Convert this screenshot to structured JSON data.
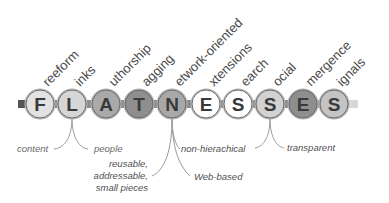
{
  "bar_color": "#7a7a7a",
  "circles": [
    {
      "letter": "F",
      "label": "reeform",
      "cx": 40,
      "fill": "#e2e2e2"
    },
    {
      "letter": "L",
      "label": "inks",
      "cx": 72,
      "fill": "#d6d6d6"
    },
    {
      "letter": "A",
      "label": "uthorship",
      "cx": 106,
      "fill": "#a9a9a9"
    },
    {
      "letter": "T",
      "label": "agging",
      "cx": 139,
      "fill": "#8e8e8e"
    },
    {
      "letter": "N",
      "label": "etwork-oriented",
      "cx": 172,
      "fill": "#a8a8a8"
    },
    {
      "letter": "E",
      "label": "xtensions",
      "cx": 206,
      "fill": "#ffffff"
    },
    {
      "letter": "S",
      "label": "earch",
      "cx": 238,
      "fill": "#ffffff"
    },
    {
      "letter": "S",
      "label": "ocial",
      "cx": 270,
      "fill": "#d2d2d2"
    },
    {
      "letter": "E",
      "label": "mergence",
      "cx": 303,
      "fill": "#8e8e8e"
    },
    {
      "letter": "S",
      "label": "ignals",
      "cx": 334,
      "fill": "#c4c4c4"
    }
  ],
  "annotations": {
    "links": {
      "left": "content",
      "right": "people"
    },
    "network_oriented": {
      "left_lines": [
        "reusable,",
        "addressable,",
        "small pieces"
      ],
      "right_top": "non-hierachical",
      "right_bottom": "Web-based"
    },
    "social": {
      "right": "transparent"
    }
  }
}
